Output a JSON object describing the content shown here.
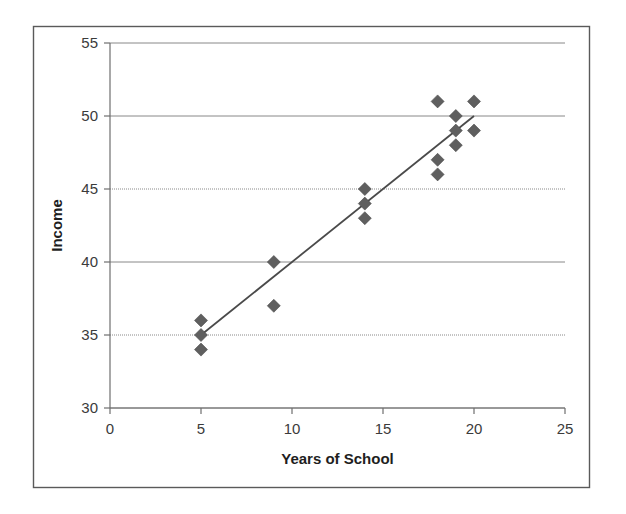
{
  "figure": {
    "background_color": "#ffffff",
    "frame_color": "#5a5a5a",
    "marker_color": "#5f5f5f",
    "gridline_color": "#888888",
    "axis_color": "#6e6e6e",
    "trendline_color": "#4a4a4a"
  },
  "chart_data": {
    "type": "scatter",
    "title": "",
    "xlabel": "Years of School",
    "ylabel": "Income",
    "xlim": [
      0,
      25
    ],
    "ylim": [
      30,
      55
    ],
    "xticks": [
      0,
      5,
      10,
      15,
      20,
      25
    ],
    "yticks": [
      30,
      35,
      40,
      45,
      50,
      55
    ],
    "xtick_labels": [
      "0",
      "5",
      "10",
      "15",
      "20",
      "25"
    ],
    "ytick_labels": [
      "30",
      "35",
      "40",
      "45",
      "50",
      "55"
    ],
    "grid": "horizontal",
    "legend": "none",
    "series": [
      {
        "name": "Income vs Years of School",
        "marker": "diamond",
        "x": [
          5,
          5,
          5,
          9,
          9,
          14,
          14,
          14,
          18,
          18,
          18,
          19,
          19,
          19,
          20,
          20
        ],
        "y": [
          36,
          35,
          34,
          40,
          37,
          45,
          44,
          43,
          51,
          47,
          46,
          50,
          49,
          48,
          51,
          49
        ]
      }
    ],
    "trendline": {
      "type": "linear",
      "x_start": 5,
      "y_start": 35,
      "x_end": 20,
      "y_end": 50
    }
  },
  "labels": {
    "y_axis_title": "Income",
    "x_axis_title": "Years of School"
  }
}
